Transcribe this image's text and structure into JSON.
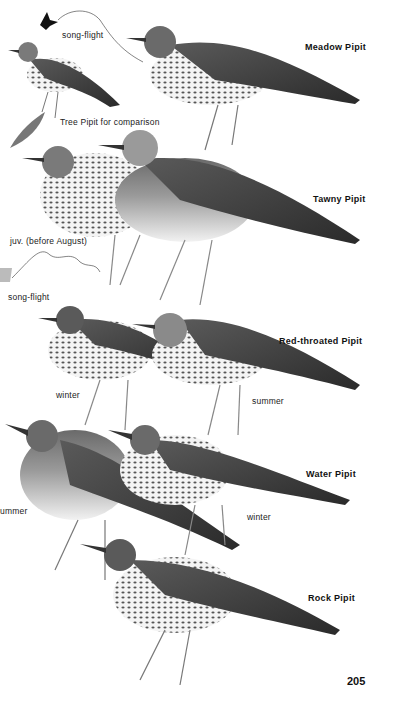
{
  "plate": {
    "page_number": "205",
    "species": [
      {
        "name": "Meadow Pipit",
        "annotations": [
          "song-flight"
        ]
      },
      {
        "name": "Tree Pipit for comparison",
        "annotations": []
      },
      {
        "name": "Tawny Pipit",
        "annotations": [
          "juv. (before August)",
          "song-flight"
        ]
      },
      {
        "name": "Red-throated Pipit",
        "annotations": [
          "winter",
          "summer"
        ]
      },
      {
        "name": "Water Pipit",
        "annotations": [
          "summer",
          "winter"
        ]
      },
      {
        "name": "Rock Pipit",
        "annotations": []
      }
    ]
  },
  "labels": {
    "meadow_pipit": "Meadow Pipit",
    "meadow_songflight": "song-flight",
    "tree_pipit": "Tree Pipit for comparison",
    "tawny_pipit": "Tawny Pipit",
    "tawny_juv": "juv. (before August)",
    "tawny_songflight": "song-flight",
    "redthroated_pipit": "Red-throated Pipit",
    "redthroated_winter": "winter",
    "redthroated_summer": "summer",
    "water_pipit": "Water Pipit",
    "water_summer": "ummer",
    "water_winter": "winter",
    "rock_pipit": "Rock Pipit",
    "page_number": "205"
  },
  "colors": {
    "background": "#ffffff",
    "ink": "#111111",
    "bird_dark": "#3a3a3a",
    "bird_mid": "#8a8a8a",
    "bird_light": "#e6e6e6"
  }
}
